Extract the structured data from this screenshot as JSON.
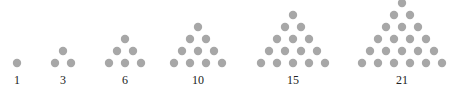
{
  "style": {
    "dot_color": "#a7a7a7",
    "label_color": "#222222",
    "dot_radius": 4.2,
    "row_spacing": 12,
    "col_spacing": 16,
    "base_y": 63,
    "label_y": 84
  },
  "triangles": [
    {
      "label": "1",
      "rows": 1,
      "center_x": 17
    },
    {
      "label": "3",
      "rows": 2,
      "center_x": 63
    },
    {
      "label": "6",
      "rows": 3,
      "center_x": 125
    },
    {
      "label": "10",
      "rows": 4,
      "center_x": 198
    },
    {
      "label": "15",
      "rows": 5,
      "center_x": 293
    },
    {
      "label": "21",
      "rows": 6,
      "center_x": 402
    }
  ]
}
